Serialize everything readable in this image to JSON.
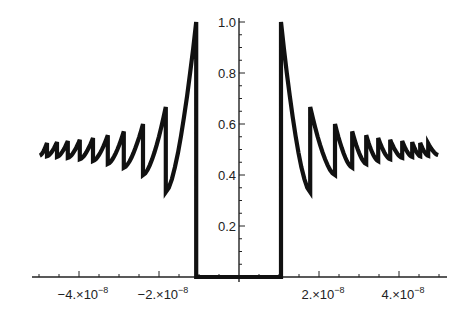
{
  "chart_data": {
    "type": "line",
    "title": "",
    "xlabel": "",
    "ylabel": "",
    "xlim": [
      -5e-08,
      5e-08
    ],
    "ylim": [
      0,
      1.0
    ],
    "grid": false,
    "legend": null,
    "x_ticks": [
      {
        "value": -4e-08,
        "label_mantissa": "-4.",
        "label_exp": "-8"
      },
      {
        "value": -2e-08,
        "label_mantissa": "-2.",
        "label_exp": "-8"
      },
      {
        "value": 2e-08,
        "label_mantissa": "2.",
        "label_exp": "-8"
      },
      {
        "value": 4e-08,
        "label_mantissa": "4.",
        "label_exp": "-8"
      }
    ],
    "x_tick_label_sep": "×10",
    "y_ticks": [
      {
        "value": 0.2,
        "label": "0.2"
      },
      {
        "value": 0.4,
        "label": "0.4"
      },
      {
        "value": 0.6,
        "label": "0.6"
      },
      {
        "value": 0.8,
        "label": "0.8"
      },
      {
        "value": 1.0,
        "label": "1.0"
      }
    ],
    "gap": {
      "x_start": -1.07e-08,
      "x_end": 1.05e-08,
      "value": 0
    },
    "series": [
      {
        "name": "sawtooth-right",
        "description": "Decaying sawtooth for x>0: segment n starts at peak n/(2n-1) and decays to trough n/(2n+1), converging to 0.5",
        "jumps_x": [
          1.05e-08,
          1.78e-08,
          2.4e-08,
          2.83e-08,
          3.18e-08,
          3.48e-08,
          3.78e-08,
          4.08e-08,
          4.33e-08,
          4.53e-08,
          4.73e-08,
          4.98e-08
        ],
        "peaks": [
          1.0,
          0.667,
          0.6,
          0.571,
          0.556,
          0.545,
          0.538,
          0.533,
          0.529,
          0.526,
          0.524
        ],
        "troughs": [
          0.333,
          0.4,
          0.429,
          0.444,
          0.455,
          0.462,
          0.467,
          0.471,
          0.474,
          0.476,
          0.478
        ]
      },
      {
        "name": "sawtooth-left",
        "description": "Mirror image of the right side for x<0",
        "jumps_x": [
          -1.07e-08,
          -1.83e-08,
          -2.4e-08,
          -2.88e-08,
          -3.28e-08,
          -3.65e-08,
          -3.98e-08,
          -4.28e-08,
          -4.55e-08,
          -4.8e-08,
          -4.98e-08
        ],
        "peaks": [
          1.0,
          0.667,
          0.6,
          0.571,
          0.556,
          0.545,
          0.538,
          0.533,
          0.529,
          0.526
        ],
        "troughs": [
          0.333,
          0.4,
          0.429,
          0.444,
          0.455,
          0.462,
          0.467,
          0.471,
          0.474,
          0.476
        ]
      }
    ]
  },
  "colors": {
    "line": "#111111",
    "axis": "#222222",
    "background": "#ffffff"
  }
}
